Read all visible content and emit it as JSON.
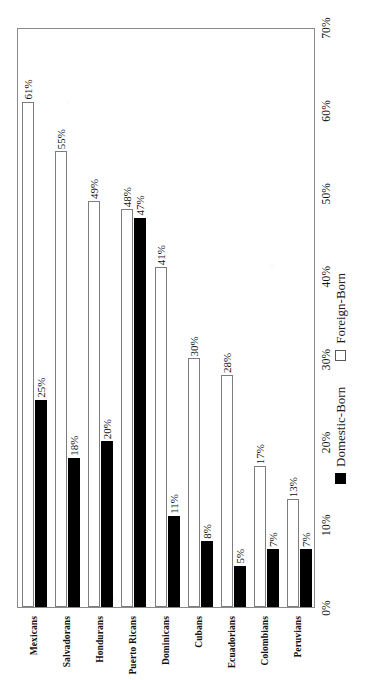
{
  "chart_data": {
    "type": "bar",
    "orientation": "horizontal",
    "title": "",
    "subtitle": "",
    "xlabel": "",
    "ylabel": "",
    "categories": [
      "Peruvians",
      "Colombians",
      "Ecuadorians",
      "Cubans",
      "Dominicans",
      "Puerto Ricans",
      "Hondurans",
      "Salvadorans",
      "Mexicans"
    ],
    "series": [
      {
        "name": "Domestic-Born",
        "color": "#000000",
        "values": [
          7,
          7,
          5,
          8,
          11,
          47,
          20,
          18,
          25
        ],
        "labels": [
          "7%",
          "7%",
          "5%",
          "8%",
          "11%",
          "47%",
          "20%",
          "18%",
          "25%"
        ]
      },
      {
        "name": "Foreign-Born",
        "color": "#FFFFFF",
        "values": [
          13,
          17,
          28,
          30,
          41,
          48,
          49,
          55,
          61
        ],
        "labels": [
          "13%",
          "17%",
          "28%",
          "30%",
          "41%",
          "48%",
          "49%",
          "55%",
          "61%"
        ]
      }
    ],
    "xticks": [
      "0%",
      "10%",
      "20%",
      "30%",
      "40%",
      "50%",
      "60%",
      "70%"
    ],
    "xtick_values": [
      0,
      10,
      20,
      30,
      40,
      50,
      60,
      70
    ],
    "xlim": [
      0,
      70
    ],
    "grid": false,
    "legend_position": "bottom",
    "legend": [
      {
        "label": "Domestic-Born",
        "swatch": "filled-black-square"
      },
      {
        "label": "Foreign-Born",
        "swatch": "outlined-white-square"
      }
    ]
  },
  "colors": {
    "domestic": "#000000",
    "foreign": "#FFFFFF",
    "bar_border": "#7D7D7D",
    "frame": "#8A8A8A",
    "background": "#FFFFFF",
    "text": "#111111"
  }
}
